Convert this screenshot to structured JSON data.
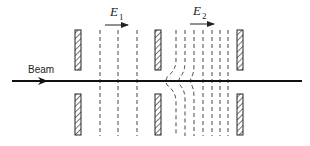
{
  "diagram": {
    "beam_label": "Beam",
    "field1": {
      "symbol": "E",
      "subscript": "1"
    },
    "field2": {
      "symbol": "E",
      "subscript": "2"
    },
    "electrodes": [
      {
        "name": "left",
        "x": 75
      },
      {
        "name": "middle",
        "x": 155
      },
      {
        "name": "right",
        "x": 237
      }
    ],
    "colors": {
      "ink": "#222222",
      "hatch_fill": "#bbbbbb",
      "background": "#ffffff"
    }
  }
}
